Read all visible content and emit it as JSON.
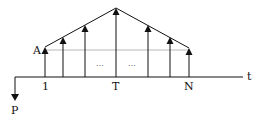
{
  "diagram": {
    "type": "cash-flow-diagram",
    "labels": {
      "amount_start": "A",
      "period_first": "1",
      "period_peak": "T",
      "period_last": "N",
      "time_axis": "t",
      "present_value": "P",
      "ellipsis_left": "...",
      "ellipsis_right": "..."
    },
    "colors": {
      "stroke": "#111111",
      "reference_line": "#999999"
    },
    "arrows": [
      {
        "x": 45,
        "top": 50
      },
      {
        "x": 63,
        "top": 40
      },
      {
        "x": 85,
        "top": 27
      },
      {
        "x": 116,
        "top": 8
      },
      {
        "x": 148,
        "top": 27
      },
      {
        "x": 170,
        "top": 40
      },
      {
        "x": 189,
        "top": 50
      }
    ]
  }
}
